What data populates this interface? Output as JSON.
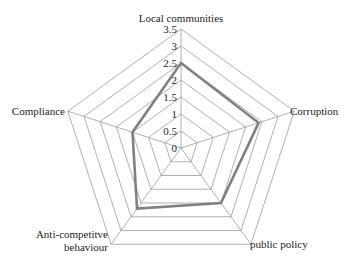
{
  "chart_data": {
    "type": "radar",
    "title": "",
    "categories": [
      "Local communities",
      "Corruption",
      "public policy",
      "Anti-competitive behaviour",
      "Compliance"
    ],
    "category_label_lines": [
      [
        "Local communities"
      ],
      [
        "Corruption"
      ],
      [
        "public policy"
      ],
      [
        "Anti-competitve",
        "behaviour"
      ],
      [
        "Compliance"
      ]
    ],
    "series": [
      {
        "name": "Score",
        "values": [
          2.5,
          2.4,
          2.0,
          2.2,
          1.5
        ],
        "color": "#808080"
      }
    ],
    "rlim": [
      0,
      3.5
    ],
    "ticks": [
      "0",
      "0.5",
      "1",
      "1.5",
      "2",
      "2.5",
      "3",
      "3.5"
    ],
    "grid": true,
    "legend": "none"
  }
}
